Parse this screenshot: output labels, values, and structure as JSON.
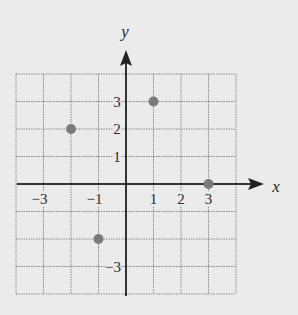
{
  "axes": {
    "x_name": "x",
    "y_name": "y"
  },
  "x_ticks": [
    {
      "value": -3,
      "label": "−3"
    },
    {
      "value": -1,
      "label": "−1"
    },
    {
      "value": 1,
      "label": "1"
    },
    {
      "value": 2,
      "label": "2"
    },
    {
      "value": 3,
      "label": "3"
    }
  ],
  "y_ticks": [
    {
      "value": 3,
      "label": "3"
    },
    {
      "value": 2,
      "label": "2"
    },
    {
      "value": 1,
      "label": "1"
    },
    {
      "value": -3,
      "label": "−3"
    }
  ],
  "chart_data": {
    "type": "scatter",
    "title": "",
    "xlabel": "x",
    "ylabel": "y",
    "xlim": [
      -4,
      4
    ],
    "ylim": [
      -4,
      4
    ],
    "grid": true,
    "points": [
      {
        "x": -2,
        "y": 2
      },
      {
        "x": 1,
        "y": 3
      },
      {
        "x": 3,
        "y": 0
      },
      {
        "x": -1,
        "y": -2
      }
    ]
  },
  "colors": {
    "background": "#ebebeb",
    "grid": "#888888",
    "axis": "#333333",
    "point": "#7a7a7a"
  }
}
